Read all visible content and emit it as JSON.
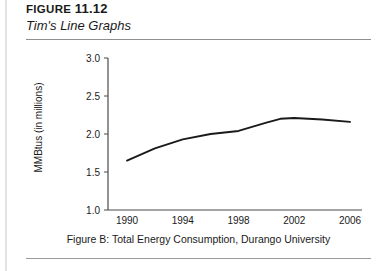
{
  "header": {
    "figure_prefix": "FIGURE",
    "figure_number": "11.12",
    "subtitle": "Tim's Line Graphs"
  },
  "caption": {
    "text": "Figure B: Total Energy Consumption, Durango University"
  },
  "colors": {
    "line": "#1a1a1a",
    "axis": "#4a4a4a",
    "rule": "#8f8f8f",
    "background": "#ffffff"
  },
  "chart_data": {
    "type": "line",
    "title": "",
    "xlabel": "",
    "ylabel": "MMBtus (in millions)",
    "xlim": [
      1989,
      2007
    ],
    "ylim": [
      1.0,
      3.0
    ],
    "grid": false,
    "legend": false,
    "xticks": [
      "1990",
      "1994",
      "1998",
      "2002",
      "2006"
    ],
    "xtick_values": [
      1990,
      1994,
      1998,
      2002,
      2006
    ],
    "yticks": [
      "1.0",
      "1.5",
      "2.0",
      "2.5",
      "3.0"
    ],
    "ytick_values": [
      1.0,
      1.5,
      2.0,
      2.5,
      3.0
    ],
    "series": [
      {
        "name": "Total Energy Consumption",
        "x": [
          1990,
          1992,
          1994,
          1996,
          1998,
          2000,
          2001,
          2002,
          2004,
          2006
        ],
        "values": [
          1.65,
          1.81,
          1.93,
          2.0,
          2.04,
          2.15,
          2.2,
          2.21,
          2.19,
          2.16
        ]
      }
    ]
  }
}
